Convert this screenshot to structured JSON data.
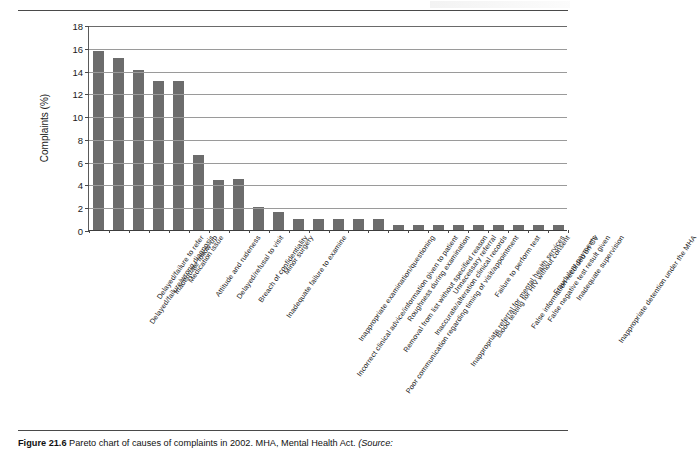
{
  "figure": {
    "number_label": "Figure 21.6",
    "caption_text": "Pareto chart of causes of complaints in 2002. MHA, Mental Health Act.",
    "caption_source": "(Source:"
  },
  "chart_data": {
    "type": "bar",
    "title": "",
    "xlabel": "",
    "ylabel": "Complaints (%)",
    "ylim": [
      0,
      18
    ],
    "ytick_step": 2,
    "yticks": [
      0,
      2,
      4,
      6,
      8,
      10,
      12,
      14,
      16,
      18
    ],
    "grid": true,
    "legend": "none",
    "bar_color": "#6c6c6c",
    "categories": [
      "Delayed/failure/wrong diagnosis",
      "Delayed/failure to refer",
      "Inadequate follow-up",
      "Medication issue",
      "Attitude and rudeness",
      "Delayed/refusal to visit",
      "Breach of confidentiality",
      "Inadequate failure to examine",
      "Minor surgery",
      "Incorrect clinical advice/information given to patient",
      "Inappropriate examination/questioning",
      "Poor communication regarding timing of visit/appointment",
      "Removal from list without specified reason",
      "Roughness during examination",
      "Inaccurate/alteration clinical records",
      "Inappropriate referral for mental health services",
      "Unnecessary referral",
      "Blood testing for HIV without consent",
      "Failure to perform test",
      "False information recorded on CV",
      "False negative test result given",
      "Fraudulent payments",
      "Inadequate supervision",
      "Inappropriate detention under the MHA"
    ],
    "values": [
      15.7,
      15.1,
      14.05,
      13.1,
      13.1,
      6.55,
      4.4,
      4.45,
      2.0,
      1.55,
      1.0,
      1.0,
      1.0,
      1.0,
      1.0,
      0.45,
      0.45,
      0.45,
      0.45,
      0.45,
      0.45,
      0.45,
      0.45,
      0.45
    ]
  }
}
